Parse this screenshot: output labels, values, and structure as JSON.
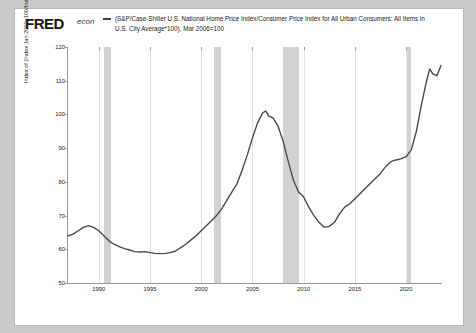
{
  "brand": {
    "name": "FRED",
    "tagline": "econ"
  },
  "chart_data": {
    "type": "line",
    "title": "(S&P/Case-Shiller U.S. National Home Price Index/Consumer Price Index for All Urban Consumers: All Items in U.S. City Average*100), Mar 2006=100",
    "ylabel": "Index of (Index Jan 2000=100/Index 1982-1984=100*100)",
    "xlabel": "",
    "ylim": [
      50,
      120
    ],
    "yticks": [
      50,
      60,
      70,
      80,
      90,
      100,
      110,
      120
    ],
    "xlim": [
      1987.0,
      2023.5
    ],
    "xticks": [
      1990,
      1995,
      2000,
      2005,
      2010,
      2015,
      2020
    ],
    "grid": "vertical",
    "legend": "none",
    "line_color": "#4a4a4a",
    "recession_color": "#d2d2d2",
    "recessions": [
      {
        "start": 1990.5,
        "end": 1991.2
      },
      {
        "start": 2001.2,
        "end": 2001.9
      },
      {
        "start": 2007.95,
        "end": 2009.5
      },
      {
        "start": 2020.1,
        "end": 2020.5
      }
    ],
    "x": [
      1987.0,
      1987.5,
      1988.0,
      1988.5,
      1989.0,
      1989.5,
      1990.0,
      1990.5,
      1991.0,
      1991.5,
      1992.0,
      1992.5,
      1993.0,
      1993.5,
      1994.0,
      1994.5,
      1995.0,
      1995.5,
      1996.0,
      1996.5,
      1997.0,
      1997.5,
      1998.0,
      1998.5,
      1999.0,
      1999.5,
      2000.0,
      2000.5,
      2001.0,
      2001.5,
      2002.0,
      2002.5,
      2003.0,
      2003.5,
      2004.0,
      2004.5,
      2005.0,
      2005.5,
      2006.0,
      2006.3,
      2006.6,
      2007.0,
      2007.5,
      2008.0,
      2008.5,
      2009.0,
      2009.5,
      2010.0,
      2010.5,
      2011.0,
      2011.5,
      2012.0,
      2012.5,
      2013.0,
      2013.5,
      2014.0,
      2014.5,
      2015.0,
      2015.5,
      2016.0,
      2016.5,
      2017.0,
      2017.5,
      2018.0,
      2018.5,
      2019.0,
      2019.5,
      2020.0,
      2020.5,
      2021.0,
      2021.5,
      2022.0,
      2022.3,
      2022.6,
      2023.0,
      2023.4
    ],
    "y": [
      64.0,
      64.5,
      65.5,
      66.5,
      67.0,
      66.5,
      65.5,
      64.0,
      62.5,
      61.5,
      60.8,
      60.2,
      59.8,
      59.3,
      59.2,
      59.3,
      59.0,
      58.8,
      58.7,
      58.8,
      59.0,
      59.5,
      60.5,
      61.5,
      62.8,
      64.0,
      65.5,
      67.0,
      68.5,
      70.0,
      72.0,
      74.5,
      77.0,
      79.5,
      83.5,
      88.0,
      93.0,
      97.5,
      100.5,
      101.0,
      99.5,
      99.0,
      96.5,
      92.0,
      86.0,
      80.5,
      77.0,
      75.5,
      72.5,
      70.0,
      68.0,
      66.5,
      66.8,
      68.0,
      70.5,
      72.5,
      73.5,
      75.0,
      76.5,
      78.0,
      79.5,
      81.0,
      82.5,
      84.5,
      86.0,
      86.5,
      86.8,
      87.5,
      89.5,
      95.0,
      103.0,
      110.0,
      113.5,
      112.0,
      111.5,
      114.5
    ]
  }
}
